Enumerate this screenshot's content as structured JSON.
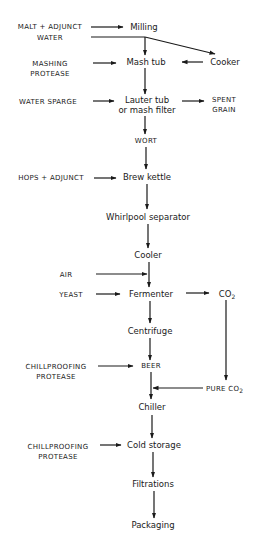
{
  "diagram": {
    "type": "process-flowchart",
    "process_nodes": {
      "milling": "Milling",
      "mash_tub": "Mash tub",
      "cooker": "Cooker",
      "lauter_1": "Lauter tub",
      "lauter_2": "or mash filter",
      "wort": "WORT",
      "brew_kettle": "Brew kettle",
      "whirlpool": "Whirlpool separator",
      "cooler": "Cooler",
      "fermenter": "Fermenter",
      "centrifuge": "Centrifuge",
      "beer": "BEER",
      "chiller": "Chiller",
      "cold_storage": "Cold storage",
      "filtrations": "Filtrations",
      "packaging": "Packaging"
    },
    "inputs": {
      "malt_adjunct": "MALT + ADJUNCT",
      "water": "WATER",
      "mashing_1": "MASHING",
      "mashing_2": "PROTEASE",
      "water_sparge": "WATER SPARGE",
      "hops_adjunct": "HOPS + ADJUNCT",
      "air": "AIR",
      "yeast": "YEAST",
      "chillproofing_a_1": "CHILLPROOFING",
      "chillproofing_a_2": "PROTEASE",
      "chillproofing_b_1": "CHILLPROOFING",
      "chillproofing_b_2": "PROTEASE"
    },
    "outputs": {
      "spent_1": "SPENT",
      "spent_2": "GRAIN",
      "co2_main": "CO",
      "co2_sub": "2",
      "pure_co2_main": "PURE CO",
      "pure_co2_sub": "2"
    },
    "edges": [
      [
        "MALT + ADJUNCT",
        "Milling"
      ],
      [
        "WATER",
        "Mash tub"
      ],
      [
        "WATER",
        "Cooker"
      ],
      [
        "Cooker",
        "Mash tub"
      ],
      [
        "MASHING PROTEASE",
        "Mash tub"
      ],
      [
        "Mash tub",
        "Lauter tub or mash filter"
      ],
      [
        "WATER SPARGE",
        "Lauter tub or mash filter"
      ],
      [
        "Lauter tub or mash filter",
        "SPENT GRAIN"
      ],
      [
        "Lauter tub or mash filter",
        "WORT"
      ],
      [
        "WORT",
        "Brew kettle"
      ],
      [
        "HOPS + ADJUNCT",
        "Brew kettle"
      ],
      [
        "Brew kettle",
        "Whirlpool separator"
      ],
      [
        "Whirlpool separator",
        "Cooler"
      ],
      [
        "Cooler",
        "Fermenter"
      ],
      [
        "AIR",
        "Fermenter"
      ],
      [
        "YEAST",
        "Fermenter"
      ],
      [
        "Fermenter",
        "CO2"
      ],
      [
        "CO2",
        "PURE CO2"
      ],
      [
        "Fermenter",
        "Centrifuge"
      ],
      [
        "Centrifuge",
        "BEER"
      ],
      [
        "CHILLPROOFING PROTEASE",
        "BEER"
      ],
      [
        "BEER",
        "Chiller"
      ],
      [
        "PURE CO2",
        "Chiller"
      ],
      [
        "Chiller",
        "Cold storage"
      ],
      [
        "CHILLPROOFING PROTEASE",
        "Cold storage"
      ],
      [
        "Cold storage",
        "Filtrations"
      ],
      [
        "Filtrations",
        "Packaging"
      ]
    ]
  }
}
